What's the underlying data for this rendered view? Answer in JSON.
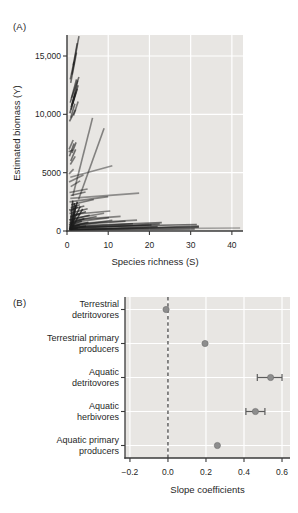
{
  "colors": {
    "page_bg": "#ffffff",
    "plot_bg": "#e8e6e3",
    "grid": "#ffffff",
    "spine": "#3a3a3a",
    "text": "#1f1f1f",
    "segment": "#1c1c1c",
    "dot_fill": "#8d8d8d",
    "dot_edge": "#6b6b6b",
    "error_bar": "#5c5c5c",
    "dashed_line": "#4a4a4a"
  },
  "chart_data": [
    {
      "type": "line-segments",
      "panel_label": "(A)",
      "title": "",
      "xlabel": "Species richness (S)",
      "ylabel": "Estimated biomass (Y)",
      "xlim": [
        0,
        42.7
      ],
      "ylim": [
        0,
        16800
      ],
      "grid": "on",
      "xticks": [
        {
          "v": 0,
          "label": "0"
        },
        {
          "v": 10,
          "label": "10"
        },
        {
          "v": 20,
          "label": "20"
        },
        {
          "v": 30,
          "label": "30"
        },
        {
          "v": 40,
          "label": "40"
        }
      ],
      "yticks": [
        {
          "v": 0,
          "label": "0"
        },
        {
          "v": 5000,
          "label": "5000"
        },
        {
          "v": 10000,
          "label": "10,000"
        },
        {
          "v": 15000,
          "label": "15,000"
        }
      ],
      "segments": [
        [
          1.2,
          13400,
          2.9,
          16700,
          0.6
        ],
        [
          0.9,
          12700,
          2.3,
          15300,
          0.6
        ],
        [
          1.5,
          14200,
          2.5,
          16100,
          0.6
        ],
        [
          0.8,
          13000,
          1.7,
          14500,
          0.6
        ],
        [
          1.0,
          10400,
          2.6,
          12900,
          0.65
        ],
        [
          1.2,
          10800,
          2.7,
          12500,
          0.65
        ],
        [
          0.8,
          11000,
          2.3,
          13000,
          0.65
        ],
        [
          1.1,
          11400,
          2.9,
          13200,
          0.6
        ],
        [
          0.7,
          10100,
          2.1,
          11900,
          0.65
        ],
        [
          1.4,
          10900,
          2.5,
          12200,
          0.65
        ],
        [
          1.0,
          10600,
          1.9,
          11700,
          0.6
        ],
        [
          0.9,
          9700,
          1.9,
          10900,
          0.6
        ],
        [
          0.6,
          9400,
          2.1,
          10400,
          0.6
        ],
        [
          1.6,
          9900,
          2.7,
          11100,
          0.55
        ],
        [
          0.6,
          6400,
          1.7,
          7500,
          0.6
        ],
        [
          0.9,
          6000,
          2.1,
          7000,
          0.6
        ],
        [
          1.2,
          6700,
          2.2,
          7600,
          0.6
        ],
        [
          0.5,
          7000,
          1.5,
          7800,
          0.55
        ],
        [
          0.4,
          6800,
          1.4,
          6950,
          0.55
        ],
        [
          0.8,
          5700,
          2.0,
          6400,
          0.55
        ],
        [
          1.4,
          3000,
          6.2,
          9700,
          0.5
        ],
        [
          2.8,
          2700,
          9.0,
          8800,
          0.5
        ],
        [
          0.8,
          4600,
          11.0,
          5600,
          0.45
        ],
        [
          0.5,
          4200,
          4.0,
          4800,
          0.5
        ],
        [
          0.9,
          3800,
          3.2,
          4300,
          0.5
        ],
        [
          0.5,
          4900,
          1.6,
          5300,
          0.5
        ],
        [
          0.6,
          3300,
          5.0,
          3600,
          0.5
        ],
        [
          0.8,
          2800,
          17.5,
          3250,
          0.45
        ],
        [
          0.6,
          2500,
          10.0,
          2950,
          0.5
        ],
        [
          0.9,
          3050,
          4.5,
          3350,
          0.55
        ],
        [
          1.0,
          2250,
          6.5,
          2700,
          0.55
        ],
        [
          0.7,
          50,
          1.4,
          2600,
          0.8
        ],
        [
          1.0,
          0,
          1.8,
          2400,
          0.8
        ],
        [
          1.3,
          100,
          2.1,
          2250,
          0.8
        ],
        [
          0.8,
          300,
          2.5,
          2500,
          0.8
        ],
        [
          0.6,
          150,
          3.2,
          2100,
          0.75
        ],
        [
          0.9,
          80,
          3.8,
          1900,
          0.75
        ],
        [
          0.5,
          1800,
          4.2,
          2150,
          0.6
        ],
        [
          0.6,
          1500,
          5.0,
          1900,
          0.6
        ],
        [
          0.8,
          1250,
          4.6,
          1650,
          0.65
        ],
        [
          0.5,
          950,
          5.5,
          1350,
          0.65
        ],
        [
          0.7,
          650,
          4.2,
          1050,
          0.7
        ],
        [
          0.6,
          350,
          5.2,
          750,
          0.7
        ],
        [
          0.5,
          160,
          4.6,
          420,
          0.7
        ],
        [
          0.9,
          2000,
          3.1,
          2250,
          0.6
        ],
        [
          0.7,
          1700,
          2.6,
          2050,
          0.6
        ],
        [
          0.8,
          1150,
          3.1,
          1450,
          0.65
        ],
        [
          0.5,
          520,
          3.6,
          840,
          0.7
        ],
        [
          0.7,
          230,
          3.1,
          540,
          0.7
        ],
        [
          0.5,
          60,
          2.6,
          260,
          0.7
        ],
        [
          1.0,
          820,
          7.2,
          1250,
          0.55
        ],
        [
          0.8,
          1020,
          9.0,
          1520,
          0.5
        ],
        [
          0.6,
          720,
          10.2,
          1150,
          0.55
        ],
        [
          0.9,
          420,
          11.0,
          920,
          0.55
        ],
        [
          1.0,
          1420,
          10.5,
          1720,
          0.5
        ],
        [
          0.8,
          930,
          13.0,
          1250,
          0.5
        ],
        [
          1.0,
          520,
          14.2,
          830,
          0.55
        ],
        [
          0.7,
          320,
          16.0,
          620,
          0.6
        ],
        [
          1.0,
          620,
          17.0,
          930,
          0.5
        ],
        [
          0.8,
          230,
          20.5,
          520,
          0.65
        ],
        [
          1.0,
          430,
          23.0,
          720,
          0.6
        ],
        [
          0.9,
          120,
          22.0,
          380,
          0.65
        ],
        [
          0.9,
          250,
          22.5,
          600,
          0.6
        ],
        [
          1.0,
          330,
          31.5,
          560,
          0.6
        ],
        [
          0.8,
          130,
          32.0,
          330,
          0.65
        ],
        [
          1.2,
          60,
          32.0,
          420,
          0.6
        ],
        [
          0.6,
          60,
          31.0,
          170,
          0.6
        ],
        [
          1.0,
          160,
          42.0,
          260,
          0.35
        ]
      ]
    },
    {
      "type": "scatter-error",
      "panel_label": "(B)",
      "title": "",
      "xlabel": "Slope coefficients",
      "categories": [
        [
          "Terrestrial",
          "detritovores"
        ],
        [
          "Terrestrial primary",
          "producers"
        ],
        [
          "Aquatic",
          "detritovores"
        ],
        [
          "Aquatic",
          "herbivores"
        ],
        [
          "Aquatic primary",
          "producers"
        ]
      ],
      "values": [
        -0.01,
        0.195,
        0.54,
        0.46,
        0.26
      ],
      "err_lo": [
        null,
        null,
        0.47,
        0.41,
        null
      ],
      "err_hi": [
        null,
        null,
        0.6,
        0.51,
        null
      ],
      "refline": 0.0,
      "xlim": [
        -0.226,
        0.642
      ],
      "xticks": [
        {
          "v": -0.2,
          "label": "−0.2"
        },
        {
          "v": 0.0,
          "label": "0.0"
        },
        {
          "v": 0.2,
          "label": "0.2"
        },
        {
          "v": 0.4,
          "label": "0.4"
        },
        {
          "v": 0.6,
          "label": "0.6"
        }
      ],
      "grid": "on",
      "legend": "none"
    }
  ]
}
